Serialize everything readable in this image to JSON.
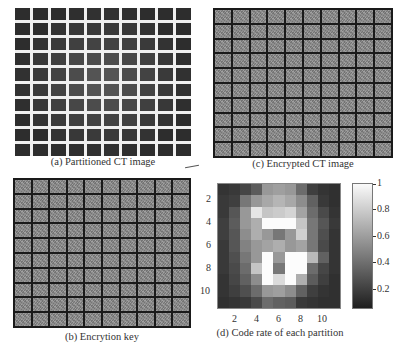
{
  "panels": {
    "a": {
      "caption": "(a) Partitioned CT image",
      "grid_rows": 10,
      "grid_cols": 10,
      "separator_color": "#f0f0f0",
      "tile_color": "#3a3a3a"
    },
    "b": {
      "caption": "(b) Encrytion key",
      "grid_rows": 10,
      "grid_cols": 10,
      "separator_color": "#1a1a1a",
      "tile_color": "#8d8d8d"
    },
    "c": {
      "caption": "(c) Encrypted CT image",
      "grid_rows": 10,
      "grid_cols": 10,
      "separator_color": "#1a1a1a",
      "tile_color": "#8d8d8d"
    },
    "d": {
      "caption": "(d) Code rate of each partition"
    }
  },
  "chart_data": {
    "type": "heatmap",
    "title": "(d) Code rate of each partition",
    "xlabel": "",
    "ylabel": "",
    "x_ticks": [
      "2",
      "4",
      "6",
      "8",
      "10"
    ],
    "y_ticks": [
      "2",
      "4",
      "6",
      "8",
      "10"
    ],
    "colorbar": {
      "ticks": [
        "1",
        "0.8",
        "0.6",
        "0.4",
        "0.2"
      ],
      "range": [
        0.05,
        1
      ],
      "colormap": "gray"
    },
    "rows": 11,
    "cols": 11,
    "values": [
      [
        0.1,
        0.12,
        0.18,
        0.28,
        0.55,
        0.58,
        0.55,
        0.35,
        0.15,
        0.1,
        0.08
      ],
      [
        0.12,
        0.15,
        0.4,
        0.55,
        0.62,
        0.68,
        0.62,
        0.5,
        0.3,
        0.12,
        0.08
      ],
      [
        0.12,
        0.25,
        0.55,
        0.9,
        0.75,
        0.78,
        0.82,
        0.6,
        0.35,
        0.2,
        0.1
      ],
      [
        0.15,
        0.28,
        0.55,
        0.65,
        1.0,
        1.0,
        1.0,
        0.75,
        0.4,
        0.25,
        0.12
      ],
      [
        0.15,
        0.25,
        0.5,
        0.65,
        0.55,
        0.4,
        0.55,
        0.8,
        0.4,
        0.22,
        0.1
      ],
      [
        0.12,
        0.25,
        0.45,
        0.55,
        0.6,
        0.65,
        0.55,
        0.6,
        0.4,
        0.2,
        0.1
      ],
      [
        0.12,
        0.22,
        0.4,
        0.55,
        1.0,
        0.55,
        1.0,
        1.0,
        0.7,
        0.3,
        0.1
      ],
      [
        0.12,
        0.2,
        0.35,
        0.75,
        1.0,
        0.4,
        1.0,
        1.0,
        0.35,
        0.18,
        0.1
      ],
      [
        0.1,
        0.18,
        0.3,
        0.5,
        1.0,
        0.85,
        1.0,
        0.65,
        0.28,
        0.15,
        0.08
      ],
      [
        0.1,
        0.15,
        0.22,
        0.35,
        0.55,
        0.58,
        0.5,
        0.3,
        0.15,
        0.1,
        0.08
      ],
      [
        0.08,
        0.1,
        0.12,
        0.2,
        0.35,
        0.3,
        0.28,
        0.12,
        0.1,
        0.08,
        0.08
      ]
    ]
  }
}
